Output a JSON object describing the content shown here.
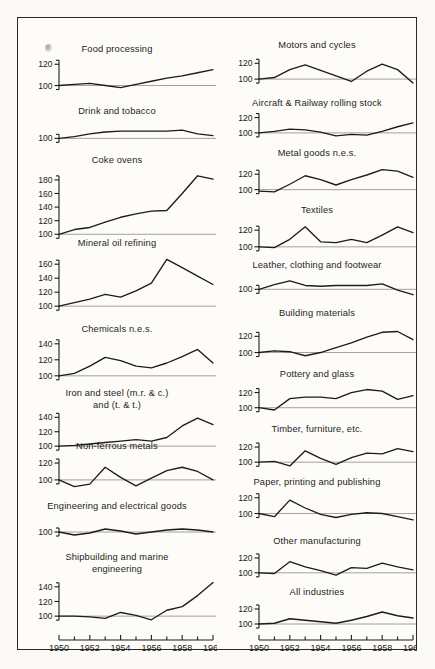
{
  "figure": {
    "page_background": "#fdfcf9",
    "ink_color": "#1d1c1a",
    "baseline_color": "#8d8a83",
    "x_axis": {
      "first_year": 1950,
      "last_year": 1960,
      "tick_years": [
        1950,
        1951,
        1952,
        1953,
        1954,
        1955,
        1956,
        1957,
        1958,
        1959,
        1960
      ],
      "labels": [
        "1950",
        "1952",
        "1954",
        "1956",
        "1958",
        "1960"
      ],
      "label_years": [
        1950,
        1952,
        1954,
        1956,
        1958,
        1960
      ]
    }
  },
  "chart_data": [
    {
      "id": "food-processing",
      "type": "line",
      "title": "Food processing",
      "column": "left",
      "x": [
        1950,
        1951,
        1952,
        1953,
        1954,
        1955,
        1956,
        1957,
        1958,
        1959,
        1960
      ],
      "values": [
        100,
        101,
        102,
        100,
        98,
        101,
        104,
        107,
        109,
        112,
        115
      ],
      "yticks": [
        100,
        120
      ],
      "ylim": [
        92,
        124
      ],
      "ylabel": "",
      "xlabel": ""
    },
    {
      "id": "drink-and-tobacco",
      "type": "line",
      "title": "Drink and tobacco",
      "column": "left",
      "x": [
        1950,
        1951,
        1952,
        1953,
        1954,
        1955,
        1956,
        1957,
        1958,
        1959,
        1960
      ],
      "values": [
        100,
        102,
        105,
        107,
        108,
        108,
        108,
        108,
        109,
        105,
        103
      ],
      "yticks": [
        100
      ],
      "ylim": [
        96,
        118
      ],
      "ylabel": "",
      "xlabel": ""
    },
    {
      "id": "coke-ovens",
      "type": "line",
      "title": "Coke ovens",
      "column": "left",
      "x": [
        1950,
        1951,
        1952,
        1953,
        1954,
        1955,
        1956,
        1957,
        1958,
        1959,
        1960
      ],
      "values": [
        100,
        107,
        110,
        118,
        125,
        130,
        134,
        135,
        160,
        186,
        181
      ],
      "yticks": [
        100,
        120,
        140,
        160,
        180
      ],
      "ylim": [
        96,
        196
      ],
      "ylabel": "",
      "xlabel": ""
    },
    {
      "id": "mineral-oil-refining",
      "type": "line",
      "title": "Mineral oil refining",
      "column": "left",
      "x": [
        1950,
        1951,
        1952,
        1953,
        1954,
        1955,
        1956,
        1957,
        1958,
        1959,
        1960
      ],
      "values": [
        100,
        105,
        110,
        117,
        113,
        122,
        133,
        167,
        155,
        143,
        131
      ],
      "yticks": [
        100,
        120,
        140,
        160
      ],
      "ylim": [
        96,
        176
      ],
      "ylabel": "",
      "xlabel": ""
    },
    {
      "id": "chemicals-nes",
      "type": "line",
      "title": "Chemicals n.e.s.",
      "column": "left",
      "x": [
        1950,
        1951,
        1952,
        1953,
        1954,
        1955,
        1956,
        1957,
        1958,
        1959,
        1960
      ],
      "values": [
        100,
        103,
        112,
        123,
        119,
        112,
        110,
        116,
        124,
        133,
        116
      ],
      "yticks": [
        100,
        120,
        140
      ],
      "ylim": [
        96,
        146
      ],
      "ylabel": "",
      "xlabel": ""
    },
    {
      "id": "iron-and-steel",
      "type": "line",
      "title": "Iron and steel (m.r. & c.) and (t. & t.)",
      "title_line1": "Iron and steel (m.r. & c.)",
      "title_line2": "and (t. & t.)",
      "column": "left",
      "x": [
        1950,
        1951,
        1952,
        1953,
        1954,
        1955,
        1956,
        1957,
        1958,
        1959,
        1960
      ],
      "values": [
        100,
        101,
        103,
        105,
        107,
        109,
        107,
        112,
        128,
        139,
        130
      ],
      "yticks": [
        100,
        120,
        140
      ],
      "ylim": [
        96,
        146
      ],
      "ylabel": "",
      "xlabel": ""
    },
    {
      "id": "non-ferrous-metals",
      "type": "line",
      "title": "Non-ferrous metals",
      "column": "left",
      "x": [
        1950,
        1951,
        1952,
        1953,
        1954,
        1955,
        1956,
        1957,
        1958,
        1959,
        1960
      ],
      "values": [
        100,
        92,
        95,
        115,
        103,
        93,
        102,
        111,
        115,
        110,
        100
      ],
      "yticks": [
        100,
        120
      ],
      "ylim": [
        88,
        126
      ],
      "ylabel": "",
      "xlabel": ""
    },
    {
      "id": "engineering-and-electrical-goods",
      "type": "line",
      "title": "Engineering and electrical goods",
      "column": "left",
      "x": [
        1950,
        1951,
        1952,
        1953,
        1954,
        1955,
        1956,
        1957,
        1958,
        1959,
        1960
      ],
      "values": [
        100,
        97,
        99,
        103,
        101,
        98,
        100,
        102,
        103,
        102,
        100
      ],
      "yticks": [
        100
      ],
      "ylim": [
        94,
        114
      ],
      "ylabel": "",
      "xlabel": ""
    },
    {
      "id": "shipbuilding-and-marine-engineering",
      "type": "line",
      "title": "Shipbuilding and marine engineering",
      "title_line1": "Shipbuilding and marine",
      "title_line2": "engineering",
      "column": "left",
      "x": [
        1950,
        1951,
        1952,
        1953,
        1954,
        1955,
        1956,
        1957,
        1958,
        1959,
        1960
      ],
      "values": [
        100,
        100,
        99,
        97,
        105,
        101,
        95,
        108,
        113,
        128,
        146
      ],
      "yticks": [
        100,
        120,
        140
      ],
      "ylim": [
        92,
        152
      ],
      "ylabel": "",
      "xlabel": ""
    },
    {
      "id": "motors-and-cycles",
      "type": "line",
      "title": "Motors and cycles",
      "column": "right",
      "x": [
        1950,
        1951,
        1952,
        1953,
        1954,
        1955,
        1956,
        1957,
        1958,
        1959,
        1960
      ],
      "values": [
        100,
        102,
        112,
        118,
        111,
        104,
        97,
        110,
        119,
        112,
        95
      ],
      "yticks": [
        100,
        120
      ],
      "ylim": [
        90,
        128
      ],
      "ylabel": "",
      "xlabel": ""
    },
    {
      "id": "aircraft-and-railway-rolling-stock",
      "type": "line",
      "title": "Aircraft  &  Railway rolling stock",
      "column": "right",
      "x": [
        1950,
        1951,
        1952,
        1953,
        1954,
        1955,
        1956,
        1957,
        1958,
        1959,
        1960
      ],
      "values": [
        100,
        102,
        105,
        104,
        101,
        96,
        98,
        97,
        102,
        108,
        113
      ],
      "yticks": [
        100,
        120
      ],
      "ylim": [
        92,
        126
      ],
      "ylabel": "",
      "xlabel": ""
    },
    {
      "id": "metal-goods-nes",
      "type": "line",
      "title": "Metal goods n.e.s.",
      "column": "right",
      "x": [
        1950,
        1951,
        1952,
        1953,
        1954,
        1955,
        1956,
        1957,
        1958,
        1959,
        1960
      ],
      "values": [
        98,
        97,
        107,
        118,
        113,
        106,
        113,
        119,
        126,
        124,
        116
      ],
      "yticks": [
        100,
        120
      ],
      "ylim": [
        93,
        132
      ],
      "ylabel": "",
      "xlabel": ""
    },
    {
      "id": "textiles",
      "type": "line",
      "title": "Textiles",
      "column": "right",
      "x": [
        1950,
        1951,
        1952,
        1953,
        1954,
        1955,
        1956,
        1957,
        1958,
        1959,
        1960
      ],
      "values": [
        100,
        99,
        109,
        124,
        106,
        105,
        109,
        105,
        114,
        124,
        117
      ],
      "yticks": [
        100,
        120
      ],
      "ylim": [
        95,
        131
      ],
      "ylabel": "",
      "xlabel": ""
    },
    {
      "id": "leather-clothing-and-footwear",
      "type": "line",
      "title": "Leather, clothing and footwear",
      "column": "right",
      "x": [
        1950,
        1951,
        1952,
        1953,
        1954,
        1955,
        1956,
        1957,
        1958,
        1959,
        1960
      ],
      "values": [
        100,
        106,
        111,
        105,
        104,
        105,
        105,
        105,
        107,
        99,
        93
      ],
      "yticks": [
        100
      ],
      "ylim": [
        90,
        116
      ],
      "ylabel": "",
      "xlabel": ""
    },
    {
      "id": "building-materials",
      "type": "line",
      "title": "Building materials",
      "column": "right",
      "x": [
        1950,
        1951,
        1952,
        1953,
        1954,
        1955,
        1956,
        1957,
        1958,
        1959,
        1960
      ],
      "values": [
        100,
        102,
        101,
        96,
        100,
        106,
        112,
        119,
        125,
        126,
        116
      ],
      "yticks": [
        100,
        120
      ],
      "ylim": [
        92,
        134
      ],
      "ylabel": "",
      "xlabel": ""
    },
    {
      "id": "pottery-and-glass",
      "type": "line",
      "title": "Pottery and glass",
      "column": "right",
      "x": [
        1950,
        1951,
        1952,
        1953,
        1954,
        1955,
        1956,
        1957,
        1958,
        1959,
        1960
      ],
      "values": [
        100,
        97,
        112,
        114,
        114,
        112,
        120,
        124,
        122,
        111,
        116
      ],
      "yticks": [
        100,
        120
      ],
      "ylim": [
        93,
        130
      ],
      "ylabel": "",
      "xlabel": ""
    },
    {
      "id": "timber-furniture-etc",
      "type": "line",
      "title": "Timber, furniture, etc.",
      "column": "right",
      "x": [
        1950,
        1951,
        1952,
        1953,
        1954,
        1955,
        1956,
        1957,
        1958,
        1959,
        1960
      ],
      "values": [
        100,
        101,
        95,
        115,
        105,
        97,
        106,
        112,
        111,
        118,
        114
      ],
      "yticks": [
        100,
        120
      ],
      "ylim": [
        91,
        128
      ],
      "ylabel": "",
      "xlabel": ""
    },
    {
      "id": "paper-printing-and-publishing",
      "type": "line",
      "title": "Paper, printing and publishing",
      "column": "right",
      "x": [
        1950,
        1951,
        1952,
        1953,
        1954,
        1955,
        1956,
        1957,
        1958,
        1959,
        1960
      ],
      "values": [
        100,
        96,
        117,
        107,
        99,
        95,
        99,
        101,
        100,
        96,
        92
      ],
      "yticks": [
        100,
        120
      ],
      "ylim": [
        88,
        126
      ],
      "ylabel": "",
      "xlabel": ""
    },
    {
      "id": "other-manufacturing",
      "type": "line",
      "title": "Other manufacturing",
      "column": "right",
      "x": [
        1950,
        1951,
        1952,
        1953,
        1954,
        1955,
        1956,
        1957,
        1958,
        1959,
        1960
      ],
      "values": [
        100,
        99,
        115,
        108,
        103,
        97,
        107,
        106,
        113,
        108,
        104
      ],
      "yticks": [
        100,
        120
      ],
      "ylim": [
        93,
        128
      ],
      "ylabel": "",
      "xlabel": ""
    },
    {
      "id": "all-industries",
      "type": "line",
      "title": "All industries",
      "column": "right",
      "x": [
        1950,
        1951,
        1952,
        1953,
        1954,
        1955,
        1956,
        1957,
        1958,
        1959,
        1960
      ],
      "values": [
        100,
        101,
        107,
        105,
        103,
        101,
        105,
        110,
        116,
        111,
        108
      ],
      "yticks": [
        100,
        120
      ],
      "ylim": [
        96,
        128
      ],
      "ylabel": "",
      "xlabel": ""
    }
  ],
  "layout": {
    "left": [
      {
        "id": "food-processing",
        "title_y": 27,
        "plot_y": 39,
        "plot_h": 42,
        "title_lines": 1
      },
      {
        "id": "drink-and-tobacco",
        "title_y": 89,
        "plot_y": 101,
        "plot_h": 28,
        "title_lines": 1
      },
      {
        "id": "coke-ovens",
        "title_y": 138,
        "plot_y": 148,
        "plot_h": 76,
        "title_lines": 1
      },
      {
        "id": "mineral-oil-refining",
        "title_y": 221,
        "plot_y": 232,
        "plot_h": 64,
        "title_lines": 1
      },
      {
        "id": "chemicals-nes",
        "title_y": 307,
        "plot_y": 318,
        "plot_h": 48,
        "title_lines": 1
      },
      {
        "id": "iron-and-steel",
        "title_y": 371,
        "plot_y": 392,
        "plot_h": 44,
        "title_lines": 2
      },
      {
        "id": "non-ferrous-metals",
        "title_y": 424,
        "plot_y": 437,
        "plot_h": 40,
        "title_lines": 1
      },
      {
        "id": "engineering-and-electrical-goods",
        "title_y": 484,
        "plot_y": 497,
        "plot_h": 28,
        "title_lines": 1
      },
      {
        "id": "shipbuilding-and-marine-engineering",
        "title_y": 535,
        "plot_y": 557,
        "plot_h": 52,
        "title_lines": 2
      }
    ],
    "right": [
      {
        "id": "motors-and-cycles",
        "title_y": 23,
        "plot_y": 36,
        "plot_h": 38,
        "title_lines": 1
      },
      {
        "id": "aircraft-and-railway-rolling-stock",
        "title_y": 81,
        "plot_y": 92,
        "plot_h": 34,
        "title_lines": 1
      },
      {
        "id": "metal-goods-nes",
        "title_y": 131,
        "plot_y": 144,
        "plot_h": 38,
        "title_lines": 1
      },
      {
        "id": "textiles",
        "title_y": 188,
        "plot_y": 200,
        "plot_h": 38,
        "title_lines": 1
      },
      {
        "id": "leather-clothing-and-footwear",
        "title_y": 243,
        "plot_y": 256,
        "plot_h": 28,
        "title_lines": 1
      },
      {
        "id": "building-materials",
        "title_y": 291,
        "plot_y": 304,
        "plot_h": 42,
        "title_lines": 1
      },
      {
        "id": "pottery-and-glass",
        "title_y": 352,
        "plot_y": 364,
        "plot_h": 36,
        "title_lines": 1
      },
      {
        "id": "timber-furniture-etc",
        "title_y": 407,
        "plot_y": 420,
        "plot_h": 36,
        "title_lines": 1
      },
      {
        "id": "paper-printing-and-publishing",
        "title_y": 460,
        "plot_y": 472,
        "plot_h": 38,
        "title_lines": 1
      },
      {
        "id": "other-manufacturing",
        "title_y": 519,
        "plot_y": 531,
        "plot_h": 34,
        "title_lines": 1
      },
      {
        "id": "all-industries",
        "title_y": 570,
        "plot_y": 582,
        "plot_h": 32,
        "title_lines": 1
      }
    ],
    "axis_left_y": 614,
    "axis_right_y": 614,
    "plot_x0": 42,
    "plot_x1": 196
  }
}
